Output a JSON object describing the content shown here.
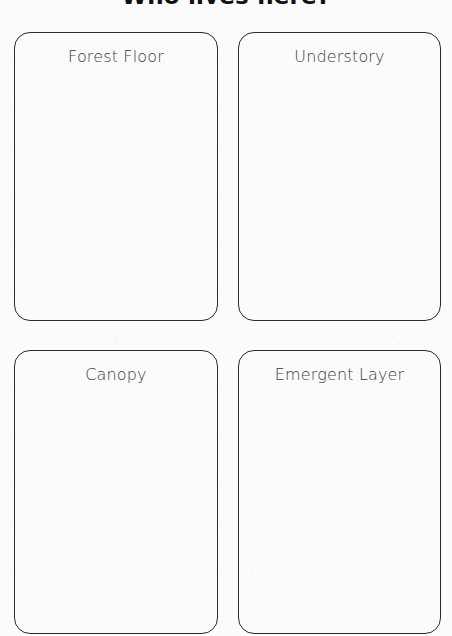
{
  "page": {
    "title": "Who lives here?",
    "background_color": "#fbfbfc",
    "ink_color": "#2a2a2a",
    "title_color": "#111111",
    "label_color": "#3a3a3a"
  },
  "cards": [
    {
      "id": "forest-floor",
      "label": "Forest Floor",
      "row": 1,
      "column": 1
    },
    {
      "id": "understory",
      "label": "Understory",
      "row": 1,
      "column": 2
    },
    {
      "id": "canopy",
      "label": "Canopy",
      "row": 2,
      "column": 1
    },
    {
      "id": "emergent-layer",
      "label": "Emergent Layer",
      "row": 2,
      "column": 2
    }
  ]
}
